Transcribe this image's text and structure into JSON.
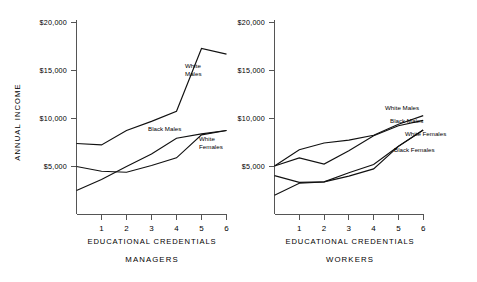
{
  "figure": {
    "background": "#ffffff",
    "ink_color": "#111111",
    "axis_color": "#555555"
  },
  "chart_data": [
    {
      "type": "line",
      "title": "MANAGERS",
      "panel": "left",
      "xlabel": "EDUCATIONAL  CREDENTIALS",
      "ylabel": "ANNUAL   INCOME",
      "x": [
        0,
        1,
        2,
        3,
        4,
        5,
        6
      ],
      "xtick_labels": [
        "1",
        "2",
        "3",
        "4",
        "5",
        "6"
      ],
      "xtick_values": [
        1,
        2,
        3,
        4,
        5,
        6
      ],
      "ytick_labels": [
        "$5,000",
        "$10,000",
        "$15,000",
        "$20,000"
      ],
      "ytick_values": [
        5000,
        10000,
        15000,
        20000
      ],
      "xlim": [
        0,
        6
      ],
      "ylim": [
        0,
        20000
      ],
      "grid": false,
      "legend_position": "inline-annotations",
      "series": [
        {
          "name": "White Males",
          "label": "White\nMales",
          "label_line1": "White",
          "label_line2": "Males",
          "values": [
            7400,
            7250,
            8750,
            9700,
            10750,
            17300,
            16700
          ]
        },
        {
          "name": "Black Males",
          "label": "Black Males",
          "values": [
            2500,
            3650,
            5000,
            6300,
            7950,
            8400,
            8750
          ]
        },
        {
          "name": "White Females",
          "label": "White\nFemales",
          "label_line1": "White",
          "label_line2": "Females",
          "values": [
            5000,
            4500,
            4400,
            5100,
            5900,
            8300,
            8750
          ]
        }
      ]
    },
    {
      "type": "line",
      "title": "WORKERS",
      "panel": "right",
      "xlabel": "EDUCATIONAL  CREDENTIALS",
      "ylabel": "",
      "x": [
        0,
        1,
        2,
        3,
        4,
        5,
        6
      ],
      "xtick_labels": [
        "1",
        "2",
        "3",
        "4",
        "5",
        "6"
      ],
      "xtick_values": [
        1,
        2,
        3,
        4,
        5,
        6
      ],
      "ytick_labels": [
        "$5,000",
        "$10,000",
        "$15,000",
        "$20,000"
      ],
      "ytick_values": [
        5000,
        10000,
        15000,
        20000
      ],
      "xlim": [
        0,
        6
      ],
      "ylim": [
        0,
        20000
      ],
      "grid": false,
      "legend_position": "inline-annotations",
      "series": [
        {
          "name": "White Males",
          "label": "White Males",
          "values": [
            5050,
            6750,
            7450,
            7750,
            8250,
            9400,
            10300
          ]
        },
        {
          "name": "Black Males",
          "label": "Black Males",
          "values": [
            5050,
            5900,
            5250,
            6650,
            8200,
            9250,
            9800
          ]
        },
        {
          "name": "White Females",
          "label": "White Females",
          "values": [
            4050,
            3350,
            3400,
            4350,
            5200,
            7100,
            8800
          ]
        },
        {
          "name": "Black Females",
          "label": "Black Females",
          "values": [
            2000,
            3250,
            3400,
            4000,
            4750,
            7100,
            8800
          ]
        }
      ]
    }
  ]
}
